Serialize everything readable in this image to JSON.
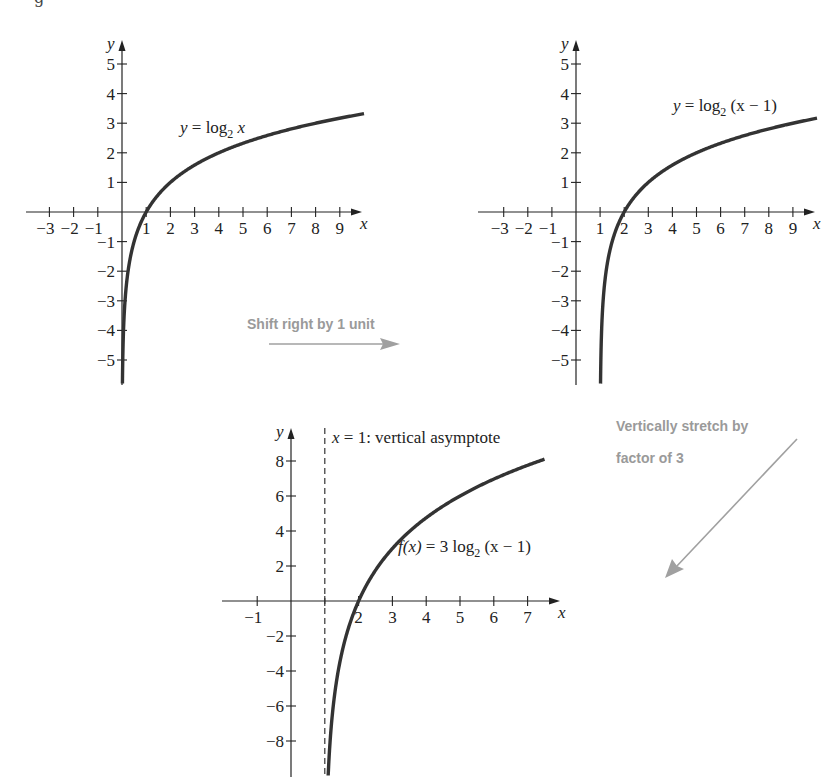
{
  "figure": {
    "top_clip_glyph": "g",
    "annotations": {
      "shift": {
        "text": "Shift right by 1 unit",
        "color": "#9a9a9a"
      },
      "stretch": {
        "line1": "Vertically stretch by",
        "line2": "factor of 3",
        "color": "#9a9a9a"
      }
    }
  },
  "chart_data": [
    {
      "type": "line",
      "id": "graph-log2x",
      "title": "y = log2 x",
      "label_parts": {
        "lhs": "y",
        "eq": " = log",
        "sub": "2",
        "arg": " x"
      },
      "function": "log2(x)",
      "xlabel": "x",
      "ylabel": "y",
      "xlim": [
        -3.5,
        10
      ],
      "ylim": [
        -5.8,
        5.8
      ],
      "x_ticks": [
        -3,
        -2,
        -1,
        1,
        2,
        3,
        4,
        5,
        6,
        7,
        8,
        9
      ],
      "y_ticks": [
        -5,
        -4,
        -3,
        -2,
        -1,
        1,
        2,
        3,
        4,
        5
      ],
      "grid": false,
      "points": [
        {
          "x": 0.018,
          "y": -5.8
        },
        {
          "x": 0.0625,
          "y": -4
        },
        {
          "x": 0.125,
          "y": -3
        },
        {
          "x": 0.25,
          "y": -2
        },
        {
          "x": 0.5,
          "y": -1
        },
        {
          "x": 1,
          "y": 0
        },
        {
          "x": 2,
          "y": 1
        },
        {
          "x": 4,
          "y": 2
        },
        {
          "x": 8,
          "y": 3
        },
        {
          "x": 10,
          "y": 3.32
        }
      ]
    },
    {
      "type": "line",
      "id": "graph-log2x-minus-1",
      "title": "y = log2 (x − 1)",
      "label_parts": {
        "lhs": "y",
        "eq": " = log",
        "sub": "2",
        "arg": " (x − 1)"
      },
      "function": "log2(x-1)",
      "xlabel": "x",
      "ylabel": "y",
      "xlim": [
        -3.5,
        10
      ],
      "ylim": [
        -5.8,
        5.8
      ],
      "x_ticks": [
        -3,
        -2,
        -1,
        1,
        2,
        3,
        4,
        5,
        6,
        7,
        8,
        9
      ],
      "y_ticks": [
        -5,
        -4,
        -3,
        -2,
        -1,
        1,
        2,
        3,
        4,
        5
      ],
      "grid": false,
      "points": [
        {
          "x": 1.018,
          "y": -5.8
        },
        {
          "x": 1.0625,
          "y": -4
        },
        {
          "x": 1.125,
          "y": -3
        },
        {
          "x": 1.25,
          "y": -2
        },
        {
          "x": 1.5,
          "y": -1
        },
        {
          "x": 2,
          "y": 0
        },
        {
          "x": 3,
          "y": 1
        },
        {
          "x": 5,
          "y": 2
        },
        {
          "x": 9,
          "y": 3
        },
        {
          "x": 10,
          "y": 3.17
        }
      ]
    },
    {
      "type": "line",
      "id": "graph-3log2x-minus-1",
      "title": "f(x) = 3 log2 (x − 1)",
      "label_parts": {
        "lhs": "f(x)",
        "eq": " = 3 log",
        "sub": "2",
        "arg": " (x − 1)"
      },
      "function": "3*log2(x-1)",
      "xlabel": "x",
      "ylabel": "y",
      "xlim": [
        -1.5,
        8
      ],
      "ylim": [
        -10,
        9.5
      ],
      "x_ticks": [
        -1,
        2,
        3,
        4,
        5,
        6,
        7
      ],
      "x_tick_marks": [
        -1,
        1,
        2,
        3,
        4,
        5,
        6,
        7
      ],
      "y_ticks": [
        -8,
        -6,
        -4,
        -2,
        2,
        4,
        6,
        8
      ],
      "grid": false,
      "asymptote": {
        "x": 1,
        "label": "x = 1: vertical asymptote",
        "label_parts": {
          "lhs": "x",
          "rest": " = 1: vertical asymptote"
        }
      },
      "points": [
        {
          "x": 1.1,
          "y": -9.97
        },
        {
          "x": 1.25,
          "y": -6
        },
        {
          "x": 1.5,
          "y": -3
        },
        {
          "x": 2,
          "y": 0
        },
        {
          "x": 3,
          "y": 3
        },
        {
          "x": 5,
          "y": 6
        },
        {
          "x": 7.5,
          "y": 8.1
        }
      ]
    }
  ]
}
